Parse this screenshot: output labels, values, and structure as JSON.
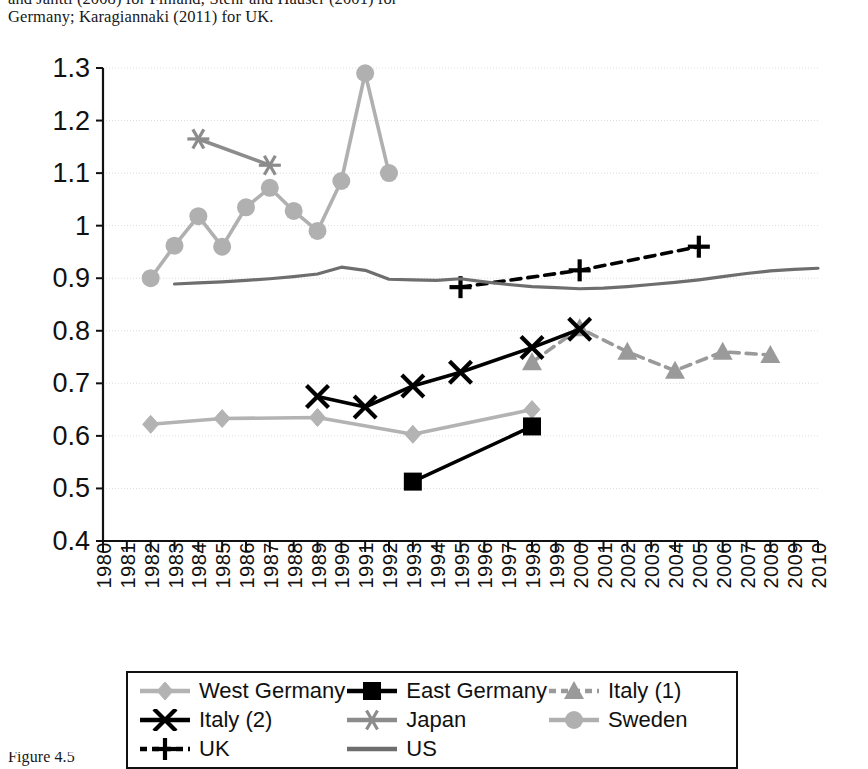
{
  "caption_top": {
    "line1": "and Jantti (2008) for Finland; Stehr and Hauser (2001) for",
    "line2": "Germany; Karagiannaki (2011) for UK."
  },
  "caption_bottom": {
    "line1": "Figure 4.5"
  },
  "chart_data": {
    "type": "line",
    "title": "",
    "xlabel": "",
    "ylabel": "",
    "xlim": [
      1980,
      2010
    ],
    "ylim": [
      0.4,
      1.3
    ],
    "grid": true,
    "legend_position": "bottom",
    "y_ticks": [
      "1.3",
      "1.2",
      "1.1",
      "1",
      "0.9",
      "0.8",
      "0.7",
      "0.6",
      "0.5",
      "0.4"
    ],
    "y_tick_values": [
      1.3,
      1.2,
      1.1,
      1.0,
      0.9,
      0.8,
      0.7,
      0.6,
      0.5,
      0.4
    ],
    "x_ticks": [
      "1980",
      "1981",
      "1982",
      "1983",
      "1984",
      "1985",
      "1986",
      "1987",
      "1988",
      "1989",
      "1990",
      "1991",
      "1992",
      "1993",
      "1994",
      "1995",
      "1996",
      "1997",
      "1998",
      "1999",
      "2000",
      "2001",
      "2002",
      "2003",
      "2004",
      "2005",
      "2006",
      "2007",
      "2008",
      "2009",
      "2010"
    ],
    "series": [
      {
        "name": "West Germany",
        "color": "#b3b3b3",
        "marker": "diamond",
        "dash": "solid",
        "x": [
          1982,
          1985,
          1989,
          1993,
          1998
        ],
        "values": [
          0.622,
          0.633,
          0.635,
          0.603,
          0.65
        ]
      },
      {
        "name": "East Germany",
        "color": "#000000",
        "marker": "square",
        "dash": "solid",
        "x": [
          1993,
          1998
        ],
        "values": [
          0.513,
          0.618
        ]
      },
      {
        "name": "Italy (1)",
        "color": "#9a9a9a",
        "marker": "triangle",
        "dash": "dashed",
        "x": [
          1998,
          2000,
          2002,
          2004,
          2006,
          2008
        ],
        "values": [
          0.74,
          0.805,
          0.76,
          0.724,
          0.76,
          0.754
        ]
      },
      {
        "name": "Italy (2)",
        "color": "#000000",
        "marker": "x",
        "dash": "solid",
        "x": [
          1989,
          1991,
          1993,
          1995,
          1998,
          2000
        ],
        "values": [
          0.675,
          0.655,
          0.695,
          0.721,
          0.768,
          0.803
        ]
      },
      {
        "name": "Japan",
        "color": "#8c8c8c",
        "marker": "asterisk",
        "dash": "solid",
        "x": [
          1984,
          1987
        ],
        "values": [
          1.165,
          1.115
        ]
      },
      {
        "name": "Sweden",
        "color": "#b0b0b0",
        "marker": "circle",
        "dash": "solid",
        "x": [
          1982,
          1983,
          1984,
          1985,
          1986,
          1987,
          1988,
          1989,
          1990,
          1991,
          1992
        ],
        "values": [
          0.9,
          0.962,
          1.018,
          0.96,
          1.035,
          1.072,
          1.028,
          0.99,
          1.085,
          1.29,
          1.1
        ]
      },
      {
        "name": "UK",
        "color": "#000000",
        "marker": "plus",
        "dash": "dashed",
        "x": [
          1995,
          2000,
          2005
        ],
        "values": [
          0.883,
          0.915,
          0.96
        ]
      },
      {
        "name": "US",
        "color": "#6e6e6e",
        "marker": "none",
        "dash": "solid",
        "x": [
          1983,
          1984,
          1985,
          1986,
          1987,
          1988,
          1989,
          1990,
          1991,
          1992,
          1993,
          1994,
          1995,
          1996,
          1997,
          1998,
          1999,
          2000,
          2001,
          2002,
          2003,
          2004,
          2005,
          2006,
          2007,
          2008,
          2009,
          2010
        ],
        "values": [
          0.889,
          0.891,
          0.893,
          0.896,
          0.899,
          0.903,
          0.908,
          0.921,
          0.915,
          0.898,
          0.897,
          0.896,
          0.899,
          0.893,
          0.888,
          0.884,
          0.882,
          0.88,
          0.881,
          0.884,
          0.888,
          0.892,
          0.897,
          0.903,
          0.909,
          0.914,
          0.917,
          0.919
        ]
      }
    ]
  },
  "legend": {
    "items": [
      {
        "label": "West Germany",
        "key": "west-germany"
      },
      {
        "label": "East Germany",
        "key": "east-germany"
      },
      {
        "label": "Italy (1)",
        "key": "italy-1"
      },
      {
        "label": "Italy (2)",
        "key": "italy-2"
      },
      {
        "label": "Japan",
        "key": "japan"
      },
      {
        "label": "Sweden",
        "key": "sweden"
      },
      {
        "label": "UK",
        "key": "uk"
      },
      {
        "label": "US",
        "key": "us"
      }
    ]
  }
}
